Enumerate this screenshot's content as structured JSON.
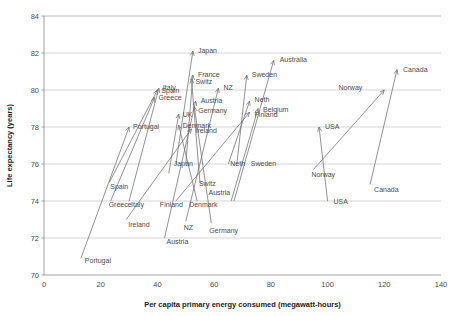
{
  "chart_data": {
    "type": "scatter",
    "title": "",
    "xlabel": "Per capita primary energy consumed (megawatt-hours)",
    "ylabel": "Life expectancy (years)",
    "xlim": [
      0,
      140
    ],
    "ylim": [
      70,
      84
    ],
    "xticks": [
      0,
      20,
      40,
      60,
      80,
      100,
      120,
      140
    ],
    "yticks": [
      70,
      72,
      74,
      76,
      78,
      80,
      82,
      84
    ],
    "grid": "horizontal",
    "legend": "none",
    "note": "Each country is drawn as an arrow from its earlier (tail) state to its later (head) state. Tail label sits near the arrow start, head label near the arrow tip.",
    "series": [
      {
        "name": "Portugal",
        "start_x": 13.0,
        "start_y": 70.9,
        "end_x": 30.0,
        "end_y": 78.0,
        "head_label": "Portugal",
        "tail_label": "Portugal"
      },
      {
        "name": "Spain",
        "start_x": 23.0,
        "start_y": 75.0,
        "end_x": 40.0,
        "end_y": 80.0,
        "head_label": "Spain",
        "tail_label": "Spain"
      },
      {
        "name": "Greece",
        "start_x": 23.5,
        "start_y": 74.0,
        "end_x": 39.0,
        "end_y": 79.6,
        "head_label": "Greece",
        "tail_label": "Greece"
      },
      {
        "name": "Italy",
        "start_x": 30.0,
        "start_y": 74.0,
        "end_x": 40.5,
        "end_y": 80.1,
        "head_label": "Italy",
        "tail_label": "Italy"
      },
      {
        "name": "Ireland",
        "start_x": 29.0,
        "start_y": 73.0,
        "end_x": 52.0,
        "end_y": 77.9,
        "head_label": "Ireland",
        "tail_label": "Ireland"
      },
      {
        "name": "Japan",
        "start_x": 46.5,
        "start_y": 76.0,
        "end_x": 52.5,
        "end_y": 82.1,
        "head_label": "Japan",
        "tail_label": "Japan"
      },
      {
        "name": "Finland",
        "start_x": 46.5,
        "start_y": 74.0,
        "end_x": 72.5,
        "end_y": 78.8,
        "head_label": "Finland",
        "tail_label": "Finland"
      },
      {
        "name": "UK",
        "start_x": 44.0,
        "start_y": 75.5,
        "end_x": 47.5,
        "end_y": 78.7,
        "head_label": "UK",
        "tail_label": ""
      },
      {
        "name": "Denmark",
        "start_x": 54.0,
        "start_y": 74.0,
        "end_x": 47.5,
        "end_y": 78.1,
        "head_label": "Denmark",
        "tail_label": "Denmark"
      },
      {
        "name": "NZ",
        "start_x": 50.0,
        "start_y": 72.9,
        "end_x": 61.5,
        "end_y": 80.1,
        "head_label": "NZ",
        "tail_label": "NZ"
      },
      {
        "name": "Austria",
        "start_x": 42.5,
        "start_y": 72.0,
        "end_x": 53.5,
        "end_y": 79.4,
        "head_label": "Austria",
        "tail_label": "Austria"
      },
      {
        "name": "Switz",
        "start_x": 55.0,
        "start_y": 75.0,
        "end_x": 52.0,
        "end_y": 80.6,
        "head_label": "Switz",
        "tail_label": "Switz"
      },
      {
        "name": "France",
        "start_x": 50.0,
        "start_y": 76.0,
        "end_x": 52.5,
        "end_y": 80.8,
        "head_label": "France",
        "tail_label": ""
      },
      {
        "name": "Germany",
        "start_x": 59.0,
        "start_y": 72.8,
        "end_x": 53.0,
        "end_y": 79.1,
        "head_label": "Germany",
        "tail_label": "Germany"
      },
      {
        "name": "Neth",
        "start_x": 65.0,
        "start_y": 76.0,
        "end_x": 72.5,
        "end_y": 79.4,
        "head_label": "Neth",
        "tail_label": "Neth"
      },
      {
        "name": "Belgium",
        "start_x": 66.0,
        "start_y": 74.0,
        "end_x": 75.5,
        "end_y": 79.0,
        "head_label": "Belgium",
        "tail_label": ""
      },
      {
        "name": "Sweden",
        "start_x": 68.0,
        "start_y": 76.0,
        "end_x": 71.5,
        "end_y": 80.8,
        "head_label": "Sweden",
        "tail_label": "Sweden"
      },
      {
        "name": "Australia",
        "start_x": 67.0,
        "start_y": 74.0,
        "end_x": 81.0,
        "end_y": 81.6,
        "head_label": "Australia",
        "tail_label": ""
      },
      {
        "name": "USA",
        "start_x": 100.0,
        "start_y": 74.0,
        "end_x": 97.0,
        "end_y": 78.0,
        "head_label": "USA",
        "tail_label": "USA"
      },
      {
        "name": "Norway",
        "start_x": 95.0,
        "start_y": 75.7,
        "end_x": 120.0,
        "end_y": 80.0,
        "head_label": "Norway",
        "tail_label": "Norway"
      },
      {
        "name": "Canada",
        "start_x": 115.0,
        "start_y": 74.9,
        "end_x": 124.5,
        "end_y": 81.1,
        "head_label": "Canada",
        "tail_label": "Canada"
      }
    ],
    "head_label_offsets": [
      {
        "name": "Portugal",
        "dx": 4,
        "dy": 2
      },
      {
        "name": "Spain",
        "dx": 4,
        "dy": 3
      },
      {
        "name": "Greece",
        "dx": 4,
        "dy": 3
      },
      {
        "name": "Italy",
        "dx": 4,
        "dy": 2
      },
      {
        "name": "Ireland",
        "dx": 4,
        "dy": 4
      },
      {
        "name": "Japan",
        "dx": 5,
        "dy": 2
      },
      {
        "name": "Finland",
        "dx": 5,
        "dy": 5
      },
      {
        "name": "UK",
        "dx": 4,
        "dy": 3
      },
      {
        "name": "Denmark",
        "dx": 4,
        "dy": 3
      },
      {
        "name": "NZ",
        "dx": 5,
        "dy": 2
      },
      {
        "name": "Austria",
        "dx": 5,
        "dy": 2
      },
      {
        "name": "Switz",
        "dx": 4,
        "dy": 5
      },
      {
        "name": "France",
        "dx": 5,
        "dy": 2
      },
      {
        "name": "Germany",
        "dx": 4,
        "dy": 6
      },
      {
        "name": "Neth",
        "dx": 5,
        "dy": 1
      },
      {
        "name": "Belgium",
        "dx": 5,
        "dy": 3
      },
      {
        "name": "Sweden",
        "dx": 5,
        "dy": 2
      },
      {
        "name": "Australia",
        "dx": 6,
        "dy": 2
      },
      {
        "name": "USA",
        "dx": 6,
        "dy": 2
      },
      {
        "name": "Norway",
        "dx": -22,
        "dy": 0
      },
      {
        "name": "Canada",
        "dx": 6,
        "dy": 2
      }
    ],
    "tail_label_offsets": [
      {
        "name": "Portugal",
        "dx": 4,
        "dy": 5
      },
      {
        "name": "Spain",
        "dx": 1,
        "dy": 6
      },
      {
        "name": "Greece",
        "dx": -2,
        "dy": 6
      },
      {
        "name": "Italy",
        "dx": 2,
        "dy": 6
      },
      {
        "name": "Ireland",
        "dx": 2,
        "dy": 7
      },
      {
        "name": "Japan",
        "dx": -2,
        "dy": 2
      },
      {
        "name": "Finland",
        "dx": -16,
        "dy": 6
      },
      {
        "name": "Denmark",
        "dx": -8,
        "dy": 6
      },
      {
        "name": "NZ",
        "dx": -2,
        "dy": 9
      },
      {
        "name": "Austria",
        "dx": 2,
        "dy": 6
      },
      {
        "name": "Switz",
        "dx": -1,
        "dy": 3
      },
      {
        "name": "Germany",
        "dx": -2,
        "dy": 10
      },
      {
        "name": "Neth",
        "dx": 2,
        "dy": 2
      },
      {
        "name": "Sweden",
        "dx": 14,
        "dy": 2
      },
      {
        "name": "USA",
        "dx": 6,
        "dy": 3
      },
      {
        "name": "Norway",
        "dx": -2,
        "dy": 7
      },
      {
        "name": "Canada",
        "dx": 4,
        "dy": 8
      }
    ],
    "extra_tail_labels": [
      {
        "name": "Austria2",
        "text": "Austria",
        "x": 58.0,
        "y": 74.3
      }
    ]
  }
}
